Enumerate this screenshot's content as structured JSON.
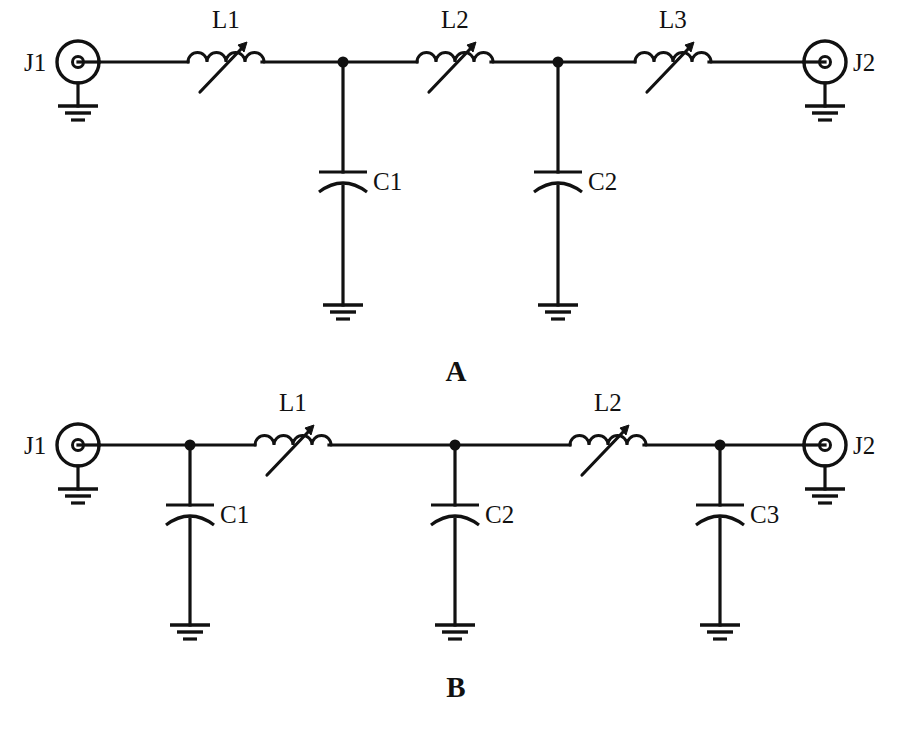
{
  "figure": {
    "type": "schematic-diagram",
    "background_color": "#ffffff",
    "ink_color": "#111111"
  },
  "panels": [
    {
      "id": "A",
      "caption": "A",
      "topology": "T-network lowpass: series L1, L2, L3 with shunt C1, C2",
      "connectors": [
        {
          "name": "left",
          "label": "J1",
          "symbol": "coax-connector-icon",
          "grounded": true
        },
        {
          "name": "right",
          "label": "J2",
          "symbol": "coax-connector-icon",
          "grounded": true
        }
      ],
      "series_elements": [
        {
          "label": "L1",
          "symbol": "variable-inductor-icon"
        },
        {
          "label": "L2",
          "symbol": "variable-inductor-icon"
        },
        {
          "label": "L3",
          "symbol": "variable-inductor-icon"
        }
      ],
      "shunt_elements": [
        {
          "label": "C1",
          "symbol": "capacitor-icon",
          "grounded": true
        },
        {
          "label": "C2",
          "symbol": "capacitor-icon",
          "grounded": true
        }
      ]
    },
    {
      "id": "B",
      "caption": "B",
      "topology": "Pi-network lowpass: shunt C1, C2, C3 with series L1, L2",
      "connectors": [
        {
          "name": "left",
          "label": "J1",
          "symbol": "coax-connector-icon",
          "grounded": true
        },
        {
          "name": "right",
          "label": "J2",
          "symbol": "coax-connector-icon",
          "grounded": true
        }
      ],
      "series_elements": [
        {
          "label": "L1",
          "symbol": "variable-inductor-icon"
        },
        {
          "label": "L2",
          "symbol": "variable-inductor-icon"
        }
      ],
      "shunt_elements": [
        {
          "label": "C1",
          "symbol": "capacitor-icon",
          "grounded": true
        },
        {
          "label": "C2",
          "symbol": "capacitor-icon",
          "grounded": true
        },
        {
          "label": "C3",
          "symbol": "capacitor-icon",
          "grounded": true
        }
      ]
    }
  ],
  "labels": {
    "a_j1": "J1",
    "a_j2": "J2",
    "a_l1": "L1",
    "a_l2": "L2",
    "a_l3": "L3",
    "a_c1": "C1",
    "a_c2": "C2",
    "a_caption": "A",
    "b_j1": "J1",
    "b_j2": "J2",
    "b_l1": "L1",
    "b_l2": "L2",
    "b_c1": "C1",
    "b_c2": "C2",
    "b_c3": "C3",
    "b_caption": "B"
  }
}
